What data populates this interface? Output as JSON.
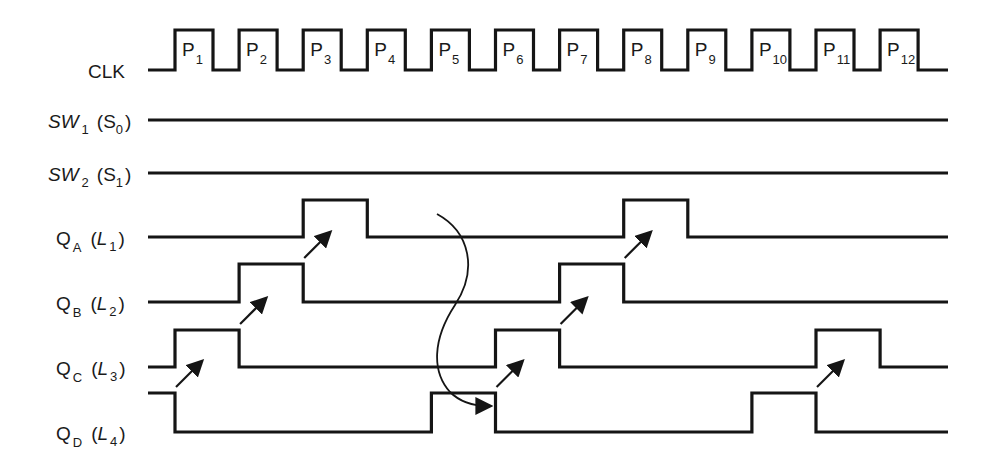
{
  "diagram": {
    "signals": [
      {
        "name": "CLK",
        "label": "CLK",
        "sub": "",
        "paren": "",
        "paren_sub": ""
      },
      {
        "name": "SW1",
        "label": "SW",
        "sub": "1",
        "paren": "S",
        "paren_sub": "0",
        "italic_label": true
      },
      {
        "name": "SW2",
        "label": "SW",
        "sub": "2",
        "paren": "S",
        "paren_sub": "1",
        "italic_label": true
      },
      {
        "name": "QA",
        "label": "Q",
        "sub": "A",
        "paren": "L",
        "paren_sub": "1",
        "italic_paren": true
      },
      {
        "name": "QB",
        "label": "Q",
        "sub": "B",
        "paren": "L",
        "paren_sub": "2",
        "italic_paren": true
      },
      {
        "name": "QC",
        "label": "Q",
        "sub": "C",
        "paren": "L",
        "paren_sub": "3",
        "italic_paren": true
      },
      {
        "name": "QD",
        "label": "Q",
        "sub": "D",
        "paren": "L",
        "paren_sub": "4",
        "italic_paren": true
      }
    ],
    "clock_pulses": [
      {
        "label": "P",
        "sub": "1"
      },
      {
        "label": "P",
        "sub": "2"
      },
      {
        "label": "P",
        "sub": "3"
      },
      {
        "label": "P",
        "sub": "4"
      },
      {
        "label": "P",
        "sub": "5"
      },
      {
        "label": "P",
        "sub": "6"
      },
      {
        "label": "P",
        "sub": "7"
      },
      {
        "label": "P",
        "sub": "8"
      },
      {
        "label": "P",
        "sub": "9"
      },
      {
        "label": "P",
        "sub": "10"
      },
      {
        "label": "P",
        "sub": "11"
      },
      {
        "label": "P",
        "sub": "12"
      }
    ],
    "states": {
      "SW1": [
        0,
        0,
        0,
        0,
        0,
        0,
        0,
        0,
        0,
        0,
        0,
        0,
        0
      ],
      "SW2": [
        0,
        0,
        0,
        0,
        0,
        0,
        0,
        0,
        0,
        0,
        0,
        0,
        0
      ],
      "QA": [
        0,
        0,
        0,
        1,
        0,
        0,
        0,
        0,
        1,
        0,
        0,
        0,
        0
      ],
      "QB": [
        0,
        0,
        1,
        0,
        0,
        0,
        0,
        1,
        0,
        0,
        0,
        0,
        0
      ],
      "QC": [
        0,
        1,
        0,
        0,
        0,
        0,
        1,
        0,
        0,
        0,
        0,
        1,
        0
      ],
      "QD": [
        1,
        0,
        0,
        0,
        0,
        1,
        0,
        0,
        0,
        0,
        1,
        0,
        0
      ]
    },
    "colors": {
      "ink": "#151515",
      "background": "#ffffff"
    }
  }
}
